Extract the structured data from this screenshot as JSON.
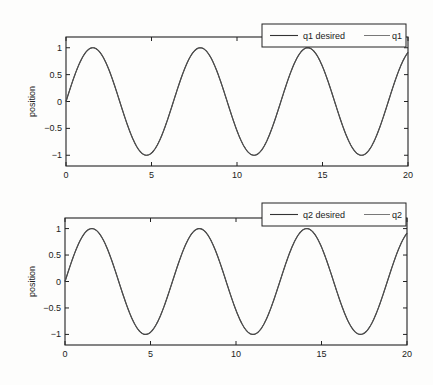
{
  "chart_data": [
    {
      "type": "line",
      "title": "",
      "xlabel": "",
      "ylabel": "position",
      "xlim": [
        0,
        20
      ],
      "ylim": [
        -1.2,
        1.2
      ],
      "xticks": [
        0,
        5,
        10,
        15,
        20
      ],
      "xtick_labels": [
        "0",
        "5",
        "10",
        "15",
        "20"
      ],
      "yticks": [
        1,
        0.5,
        0,
        -0.5,
        -1
      ],
      "ytick_labels": [
        "1",
        "0.5",
        "0",
        "-0.5",
        "-1"
      ],
      "grid": false,
      "legend_position": "top-right",
      "function": "sin(t)",
      "series": [
        {
          "name": "q1 desired",
          "color": "#333333",
          "style": "solid",
          "function": "sin(t)"
        },
        {
          "name": "q1",
          "color": "#555555",
          "style": "solid",
          "function": "sin(t)"
        }
      ],
      "x": [
        0,
        1.57,
        4.71,
        7.85,
        11.0,
        14.14,
        17.28,
        20
      ],
      "values": [
        0,
        1,
        -1,
        1,
        -1,
        1,
        -1,
        0.913
      ]
    },
    {
      "type": "line",
      "title": "",
      "xlabel": "",
      "ylabel": "position",
      "xlim": [
        0,
        20
      ],
      "ylim": [
        -1.2,
        1.2
      ],
      "xticks": [
        0,
        5,
        10,
        15,
        20
      ],
      "xtick_labels": [
        "0",
        "5",
        "10",
        "15",
        "20"
      ],
      "yticks": [
        1,
        0.5,
        0,
        -0.5,
        -1
      ],
      "ytick_labels": [
        "1",
        "0.5",
        "0",
        "-0.5",
        "-1"
      ],
      "grid": false,
      "legend_position": "top-right",
      "function": "sin(t)",
      "series": [
        {
          "name": "q2 desired",
          "color": "#333333",
          "style": "solid",
          "function": "sin(t)"
        },
        {
          "name": "q2",
          "color": "#555555",
          "style": "solid",
          "function": "sin(t)"
        }
      ],
      "x": [
        0,
        1.57,
        4.71,
        7.85,
        11.0,
        14.14,
        17.28,
        20
      ],
      "values": [
        0,
        1,
        -1,
        1,
        -1,
        1,
        -1,
        0.913
      ]
    }
  ]
}
